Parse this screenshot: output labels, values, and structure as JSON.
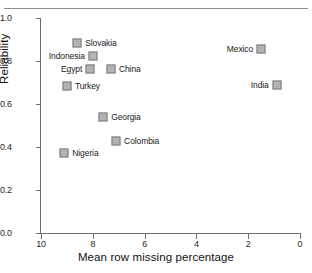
{
  "figure": {
    "running_head": "",
    "marker_color": "#b3b3b3",
    "marker_border_color": "#7d7d7d",
    "axis_color": "#6e6e6e"
  },
  "chart_data": {
    "type": "scatter",
    "title": "",
    "xlabel": "Mean row missing percentage",
    "ylabel": "Reliability",
    "xlim": [
      10,
      0
    ],
    "ylim": [
      0.0,
      1.0
    ],
    "x_reversed": true,
    "grid": false,
    "legend": "none",
    "xticks": [
      "10",
      "8",
      "6",
      "4",
      "2",
      "0"
    ],
    "xtick_values": [
      10,
      8,
      6,
      4,
      2,
      0
    ],
    "yticks": [
      "0.0",
      "0.2",
      "0.4",
      "0.6",
      "0.8",
      "1.0"
    ],
    "ytick_values": [
      0.0,
      0.2,
      0.4,
      0.6,
      0.8,
      1.0
    ],
    "points": [
      {
        "label": "Slovakia",
        "x": 8.6,
        "y": 0.885,
        "label_side": "right"
      },
      {
        "label": "Indonesia",
        "x": 8.0,
        "y": 0.825,
        "label_side": "left"
      },
      {
        "label": "Egypt",
        "x": 8.1,
        "y": 0.765,
        "label_side": "left"
      },
      {
        "label": "China",
        "x": 7.3,
        "y": 0.765,
        "label_side": "right"
      },
      {
        "label": "Turkey",
        "x": 9.0,
        "y": 0.685,
        "label_side": "right"
      },
      {
        "label": "Mexico",
        "x": 1.5,
        "y": 0.855,
        "label_side": "left"
      },
      {
        "label": "India",
        "x": 0.9,
        "y": 0.69,
        "label_side": "left"
      },
      {
        "label": "Georgia",
        "x": 7.6,
        "y": 0.54,
        "label_side": "right"
      },
      {
        "label": "Colombia",
        "x": 7.1,
        "y": 0.43,
        "label_side": "right"
      },
      {
        "label": "Nigeria",
        "x": 9.1,
        "y": 0.37,
        "label_side": "right"
      }
    ]
  }
}
